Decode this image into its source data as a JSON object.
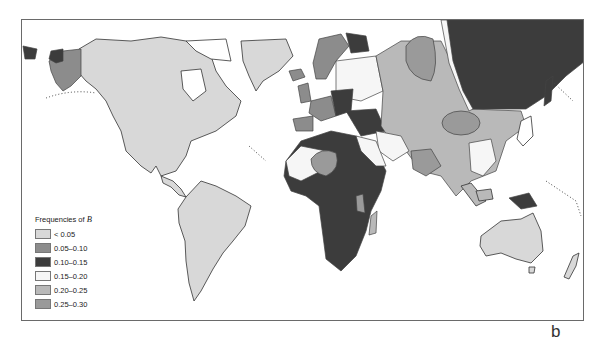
{
  "map": {
    "legend": {
      "title_prefix": "Frequencies of ",
      "title_variable": "B",
      "items": [
        {
          "label": "< 0.05",
          "color": "#d8d8d8"
        },
        {
          "label": "0.05–0.10",
          "color": "#8c8c8c"
        },
        {
          "label": "0.10–0.15",
          "color": "#3c3c3c"
        },
        {
          "label": "0.15–0.20",
          "color": "#f6f6f6"
        },
        {
          "label": "0.20–0.25",
          "color": "#b9b9b9"
        },
        {
          "label": "0.25–0.30",
          "color": "#9a9a9a"
        }
      ]
    },
    "regions": [
      {
        "name": "Americas",
        "frequency": "< 0.05"
      },
      {
        "name": "Australia",
        "frequency": "< 0.05"
      },
      {
        "name": "Siberia",
        "frequency": "0.10–0.15"
      },
      {
        "name": "Sub-Saharan Africa",
        "frequency": "0.10–0.15"
      },
      {
        "name": "Central Asia",
        "frequency": "0.20–0.25"
      },
      {
        "name": "Western Europe",
        "frequency": "0.05–0.10"
      },
      {
        "name": "South Asia",
        "frequency": "0.25–0.30"
      }
    ]
  },
  "panel_label": "b"
}
